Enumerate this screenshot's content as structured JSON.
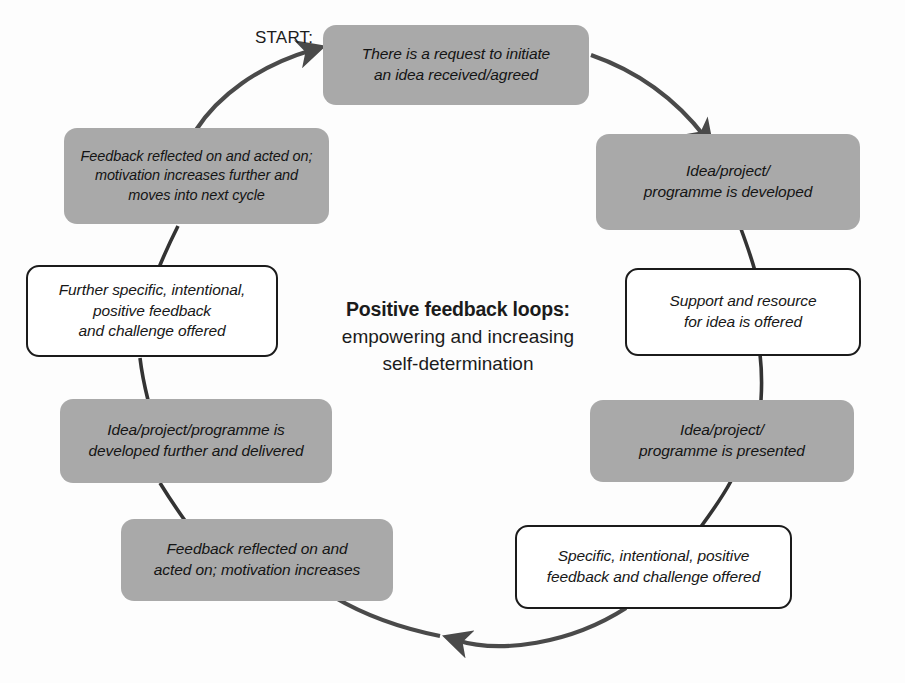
{
  "diagram": {
    "title_bold": "Positive feedback loops:",
    "subtitle_line1": "empowering and increasing",
    "subtitle_line2": "self-determination",
    "start_label": "START:",
    "stroke_color": "#4a4a4a",
    "fill_color": "#a9a9a9",
    "outline_color": "#1b1b1b",
    "background_color": "#fdfdfd"
  },
  "nodes": [
    {
      "id": "request-initiate",
      "style": "filled",
      "lines": [
        "There is a request to initiate",
        "an idea received/agreed"
      ]
    },
    {
      "id": "idea-developed",
      "style": "filled",
      "lines": [
        "Idea/project/",
        "programme is developed"
      ]
    },
    {
      "id": "support-resource",
      "style": "outlined",
      "lines": [
        "Support and resource",
        "for idea is offered"
      ]
    },
    {
      "id": "idea-presented",
      "style": "filled",
      "lines": [
        "Idea/project/",
        "programme is presented"
      ]
    },
    {
      "id": "specific-feedback",
      "style": "outlined",
      "lines": [
        "Specific, intentional, positive",
        "feedback and challenge offered"
      ]
    },
    {
      "id": "feedback-reflected",
      "style": "filled",
      "lines": [
        "Feedback reflected on and",
        "acted on; motivation increases"
      ]
    },
    {
      "id": "developed-delivered",
      "style": "filled",
      "lines": [
        "Idea/project/programme is",
        "developed further and delivered"
      ]
    },
    {
      "id": "further-specific-feedback",
      "style": "outlined",
      "lines": [
        "Further specific, intentional,",
        "positive feedback",
        "and challenge offered"
      ]
    },
    {
      "id": "feedback-next-cycle",
      "style": "filled",
      "lines": [
        "Feedback reflected on and acted on;",
        "motivation increases further and",
        "moves into next cycle"
      ]
    }
  ]
}
